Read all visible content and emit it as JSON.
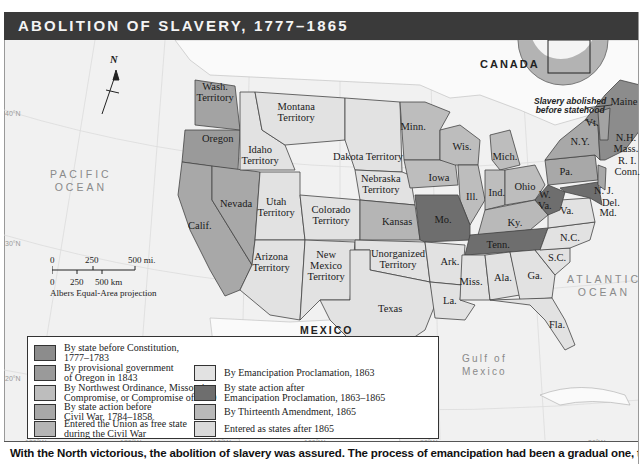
{
  "title": "ABOLITION OF SLAVERY, 1777–1865",
  "caption": "With the North victorious, the abolition of slavery was assured. The process of emancipation had been a gradual one, the result of",
  "colors": {
    "before_constitution": "#8c8c8c",
    "oregon_1843": "#9a9a9a",
    "northwest_ordinance": "#bdbdbd",
    "state_action_before_war": "#a8a8a8",
    "free_state_civil_war": "#b5b5b5",
    "emancipation_proclamation": "#e2e2e2",
    "state_action_after": "#6e6e6e",
    "thirteenth_amendment": "#b9b9b9",
    "after_1865": "#dadada",
    "water": "#f1f1f1",
    "foreign_land": "#fafafa"
  },
  "legend": {
    "left": [
      {
        "key": "before_constitution",
        "label": "By state before Constitution,\n1777–1783"
      },
      {
        "key": "oregon_1843",
        "label": "By provisional government\nof Oregon in 1843"
      },
      {
        "key": "northwest_ordinance",
        "label": "By Northwest Ordinance, Missouri\nCompromise, or Compromise of 1850"
      },
      {
        "key": "state_action_before_war",
        "label": "By state action before\nCivil War, 1784–1858"
      },
      {
        "key": "free_state_civil_war",
        "label": "Entered the Union as free state\nduring the Civil War"
      }
    ],
    "right": [
      {
        "key": "emancipation_proclamation",
        "label": "By Emancipation Proclamation, 1863"
      },
      {
        "key": "state_action_after",
        "label": "By state action after\nEmancipation Proclamation, 1863–1865"
      },
      {
        "key": "thirteenth_amendment",
        "label": "By Thirteenth Amendment, 1865"
      },
      {
        "key": "after_1865",
        "label": "Entered as states after 1865"
      }
    ]
  },
  "places": {
    "canada": "CANADA",
    "mexico": "MEXICO",
    "pacific": "PACIFIC\nOCEAN",
    "atlantic": "ATLANTIC\nOCEAN",
    "gulf": "Gulf of\nMexico",
    "note": "Slavery abolished\nbefore statehood"
  },
  "regions": [
    {
      "name": "Wash.\nTerritory",
      "x": 215,
      "y": 92
    },
    {
      "name": "Oregon",
      "x": 218,
      "y": 138
    },
    {
      "name": "Montana\nTerritory",
      "x": 296,
      "y": 112
    },
    {
      "name": "Idaho\nTerritory",
      "x": 260,
      "y": 155
    },
    {
      "name": "Dakota Territory",
      "x": 368,
      "y": 156
    },
    {
      "name": "Minn.",
      "x": 413,
      "y": 126
    },
    {
      "name": "Wis.",
      "x": 462,
      "y": 146
    },
    {
      "name": "Mich.",
      "x": 505,
      "y": 156
    },
    {
      "name": "Nevada",
      "x": 236,
      "y": 203
    },
    {
      "name": "Calif.",
      "x": 200,
      "y": 225
    },
    {
      "name": "Utah\nTerritory",
      "x": 276,
      "y": 207
    },
    {
      "name": "Colorado\nTerritory",
      "x": 331,
      "y": 215
    },
    {
      "name": "Nebraska\nTerritory",
      "x": 381,
      "y": 184
    },
    {
      "name": "Iowa",
      "x": 439,
      "y": 177
    },
    {
      "name": "Ill.",
      "x": 472,
      "y": 196
    },
    {
      "name": "Ind.",
      "x": 497,
      "y": 192
    },
    {
      "name": "Ohio",
      "x": 525,
      "y": 186
    },
    {
      "name": "Kansas",
      "x": 397,
      "y": 221
    },
    {
      "name": "Mo.",
      "x": 443,
      "y": 219
    },
    {
      "name": "Ky.",
      "x": 515,
      "y": 222
    },
    {
      "name": "Arizona\nTerritory",
      "x": 271,
      "y": 262
    },
    {
      "name": "New\nMexico\nTerritory",
      "x": 326,
      "y": 265
    },
    {
      "name": "Unorganized\nTerritory",
      "x": 398,
      "y": 259
    },
    {
      "name": "Tenn.",
      "x": 498,
      "y": 244
    },
    {
      "name": "Ark.",
      "x": 450,
      "y": 261
    },
    {
      "name": "Texas",
      "x": 390,
      "y": 308
    },
    {
      "name": "Miss.",
      "x": 471,
      "y": 281
    },
    {
      "name": "Ala.",
      "x": 503,
      "y": 277
    },
    {
      "name": "Ga.",
      "x": 535,
      "y": 275
    },
    {
      "name": "La.",
      "x": 450,
      "y": 300
    },
    {
      "name": "Fla.",
      "x": 557,
      "y": 324
    },
    {
      "name": "S.C.",
      "x": 557,
      "y": 257
    },
    {
      "name": "N.C.",
      "x": 570,
      "y": 237
    },
    {
      "name": "Va.",
      "x": 567,
      "y": 210
    },
    {
      "name": "W.\nVa.",
      "x": 545,
      "y": 200
    },
    {
      "name": "Pa.",
      "x": 566,
      "y": 171
    },
    {
      "name": "N.Y.",
      "x": 580,
      "y": 141
    },
    {
      "name": "Maine",
      "x": 624,
      "y": 101
    },
    {
      "name": "Vt.",
      "x": 592,
      "y": 122
    },
    {
      "name": "N.H.\nMass.",
      "x": 626,
      "y": 143
    },
    {
      "name": "R. I.\nConn.",
      "x": 627,
      "y": 166
    },
    {
      "name": "N. J.",
      "x": 604,
      "y": 190
    },
    {
      "name": "Del.",
      "x": 611,
      "y": 202
    },
    {
      "name": "Md.",
      "x": 608,
      "y": 212
    }
  ],
  "coordinates": {
    "lat": [
      "40°N",
      "30°N",
      "20°N"
    ],
    "lon": [
      "130°W",
      "120°W",
      "110°W",
      "100°W",
      "90°W",
      "80°W"
    ]
  },
  "scale": {
    "mi": [
      "0",
      "250",
      "500 mi."
    ],
    "km": [
      "0",
      "250",
      "500 km"
    ],
    "projection": "Albers Equal-Area projection"
  },
  "north": "N"
}
